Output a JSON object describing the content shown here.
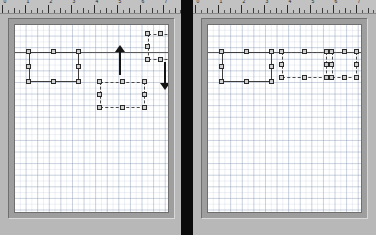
{
  "window": {
    "title": "Align Top — before and after",
    "background_color": "#0a0a0a",
    "divider_color": "#0b0b0b"
  },
  "colors": {
    "panel_chrome": "#b8b8b8",
    "ruler": "#c2c2c2",
    "canvas": "#ffffff",
    "grid_line": "#7a8cb0",
    "shape_stroke": "#3d3d3d",
    "handle_fill": "#d0d0d0",
    "handle_stroke": "#2b2b2b",
    "guide_line": "#5a5a5a",
    "arrow": "#141414"
  },
  "panels": [
    {
      "id": "before",
      "name": "before-panel",
      "ruler": {
        "name": "horizontal-ruler",
        "unit_labels": [
          "0",
          "1",
          "2",
          "3",
          "4",
          "5",
          "6",
          "7"
        ],
        "major_spacing_px": 23,
        "minor_per_major": 4
      },
      "canvas": {
        "name": "drawing-canvas",
        "grid_visible": true,
        "grid_spacing_px": 11.6,
        "guide_y": 27
      },
      "shapes": [
        {
          "name": "rectangle-left",
          "selected": true,
          "stroke": "solid",
          "x": 14,
          "y": 27,
          "w": 50,
          "h": 30
        },
        {
          "name": "rectangle-middle",
          "selected": true,
          "stroke": "dashed",
          "x": 85,
          "y": 57,
          "w": 45,
          "h": 26
        },
        {
          "name": "rectangle-right",
          "selected": true,
          "stroke": "dashed",
          "x": 133,
          "y": 9,
          "w": 25,
          "h": 26
        }
      ],
      "annotations": [
        {
          "name": "arrow-up",
          "direction": "up",
          "x": 105,
          "y": 20,
          "h": 30
        },
        {
          "name": "arrow-down",
          "direction": "down",
          "x": 150,
          "y": 37,
          "h": 28
        }
      ]
    },
    {
      "id": "after",
      "name": "after-panel",
      "ruler": {
        "name": "horizontal-ruler",
        "unit_labels": [
          "0",
          "1",
          "2",
          "3",
          "4",
          "5",
          "6",
          "7"
        ],
        "major_spacing_px": 23,
        "minor_per_major": 4
      },
      "canvas": {
        "name": "drawing-canvas",
        "grid_visible": true,
        "grid_spacing_px": 11.6,
        "guide_y": 27
      },
      "shapes": [
        {
          "name": "rectangle-left",
          "selected": true,
          "stroke": "solid",
          "x": 14,
          "y": 27,
          "w": 50,
          "h": 30
        },
        {
          "name": "rectangle-middle",
          "selected": true,
          "stroke": "dashed",
          "x": 74,
          "y": 27,
          "w": 45,
          "h": 26
        },
        {
          "name": "rectangle-right",
          "selected": true,
          "stroke": "dashed",
          "x": 124,
          "y": 27,
          "w": 25,
          "h": 26
        }
      ],
      "annotations": []
    }
  ]
}
